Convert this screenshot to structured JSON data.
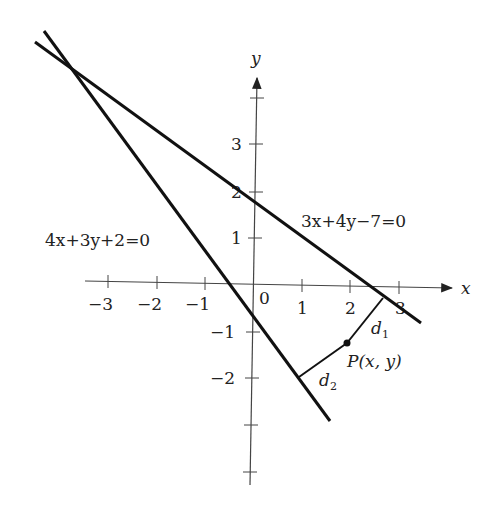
{
  "figure": {
    "axes": {
      "x_label": "x",
      "y_label": "y",
      "x_ticks": [
        "−3",
        "−2",
        "−1",
        "0",
        "1",
        "2",
        "3"
      ],
      "y_ticks_pos": [
        "1",
        "2",
        "3"
      ],
      "y_ticks_neg": [
        "−1",
        "−2"
      ],
      "origin_label": "0"
    },
    "lines": [
      {
        "name": "line-1",
        "equation": "4x+3y+2=0"
      },
      {
        "name": "line-2",
        "equation": "3x+4y−7=0"
      }
    ],
    "point": {
      "label": "P(x, y)"
    },
    "distances": {
      "d1": "d",
      "d1_sub": "1",
      "d2": "d",
      "d2_sub": "2"
    },
    "colors": {
      "line": "#111111",
      "axis": "#444444",
      "background": "#ffffff"
    }
  }
}
